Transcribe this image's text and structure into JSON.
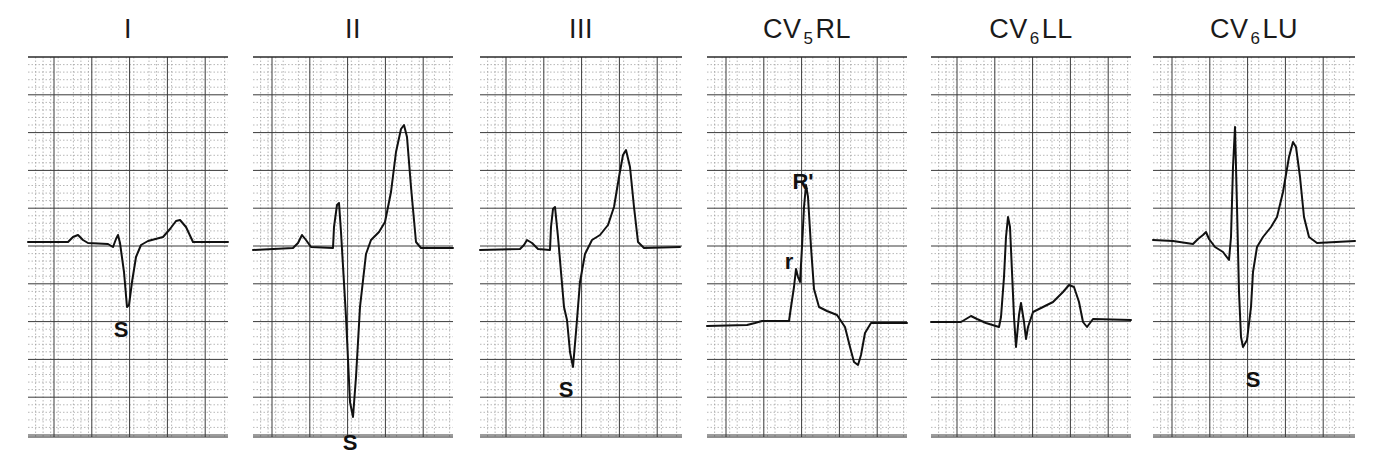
{
  "figure": {
    "type": "ecg-lead-strips",
    "leads": [
      {
        "name": "I",
        "base": "I",
        "sub": "",
        "suffix": "",
        "x": 28,
        "width": 200,
        "baseline": 185,
        "annotations": [
          {
            "text": "S",
            "x": 93,
            "y": 280
          }
        ]
      },
      {
        "name": "II",
        "base": "II",
        "sub": "",
        "suffix": "",
        "x": 253,
        "width": 200,
        "baseline": 193,
        "annotations": [
          {
            "text": "S",
            "x": 97,
            "y": 393
          }
        ]
      },
      {
        "name": "III",
        "base": "III",
        "sub": "",
        "suffix": "",
        "x": 480,
        "width": 202,
        "baseline": 193,
        "annotations": [
          {
            "text": "S",
            "x": 86,
            "y": 340
          }
        ]
      },
      {
        "name": "CV5RL",
        "base": "CV",
        "sub": "5",
        "suffix": "RL",
        "x": 707,
        "width": 200,
        "baseline": 269,
        "annotations": [
          {
            "text": "r",
            "x": 82,
            "y": 212
          },
          {
            "text": "R'",
            "x": 96,
            "y": 132
          }
        ]
      },
      {
        "name": "CV6LL",
        "base": "CV",
        "sub": "6",
        "suffix": "LL",
        "x": 931,
        "width": 200,
        "baseline": 265,
        "annotations": []
      },
      {
        "name": "CV6LU",
        "base": "CV",
        "sub": "6",
        "suffix": "LU",
        "x": 1153,
        "width": 202,
        "baseline": 183,
        "annotations": [
          {
            "text": "S",
            "x": 100,
            "y": 330
          }
        ]
      }
    ],
    "grid": {
      "height": 380,
      "major_px": 37.8,
      "minor_per_major": 5
    },
    "colors": {
      "trace": "#111111",
      "grid_major": "#3a3a3a",
      "grid_minor": "#9a9a9a",
      "background": "#ffffff"
    }
  },
  "traces": {
    "I": "0,185 40,185 45,180 50,178 55,183 60,186 80,187 85,190 88,182 90,178 92,186 96,215 99,250 101,248 104,225 108,200 113,188 120,184 135,180 142,172 148,164 152,163 158,170 165,185 200,185",
    "II": "0,193 40,191 45,186 49,178 53,183 58,190 80,191 81,170 84,148 86,146 88,175 93,260 97,345 100,360 103,320 107,250 113,197 118,183 126,175 132,165 138,135 143,95 148,72 151,68 154,80 158,130 163,185 168,191 200,191",
    "III": "0,193 40,192 44,188 47,183 52,186 58,192 70,193 71,170 73,152 75,150 78,180 81,215 84,250 87,263 90,295 93,310 96,275 100,225 105,197 112,183 120,178 128,168 134,150 139,120 143,98 146,93 150,110 154,150 158,185 164,191 200,190",
    "CV5RL": "0,269 40,268 48,266 55,264 65,264 82,264 84,250 87,230 89,212 91,220 93,225 95,190 97,150 99,128 101,140 104,190 107,232 112,250 120,254 130,258 138,270 143,290 147,305 151,308 154,298 158,276 164,266 200,266",
    "CV6LL": "0,265 30,265 35,262 40,259 46,262 55,266 68,270 70,260 73,220 75,180 77,160 79,170 81,215 83,260 85,290 88,258 90,246 93,265 95,282 97,270 102,255 112,250 122,245 132,235 138,228 143,230 148,245 152,265 156,270 162,262 200,263",
    "CV6LU": "0,183 20,184 40,187 45,182 50,178 53,175 56,182 62,190 70,195 76,203 78,180 80,110 82,70 84,150 86,235 88,280 90,290 94,283 98,250 100,215 104,190 110,180 118,170 124,160 130,135 136,100 140,85 143,90 147,120 151,160 156,180 164,186 202,184"
  },
  "footer": {
    "caption": ""
  }
}
